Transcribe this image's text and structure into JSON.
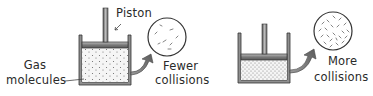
{
  "diagram": {
    "left_panel": {
      "piston_label": "Piston",
      "gas_label_line1": "Gas",
      "gas_label_line2": "molecules",
      "zoom_label_line1": "Fewer",
      "zoom_label_line2": "collisions",
      "state": "expanded"
    },
    "right_panel": {
      "zoom_label_line1": "More",
      "zoom_label_line2": "collisions",
      "state": "compressed"
    },
    "colors": {
      "outline": "#3a3a3a",
      "container_fill": "#9a9a9a",
      "piston_fill": "#8c8c8c",
      "gas_fill": "#f4f4f4",
      "dot": "#555555",
      "arrow": "#7a7a7a"
    }
  }
}
